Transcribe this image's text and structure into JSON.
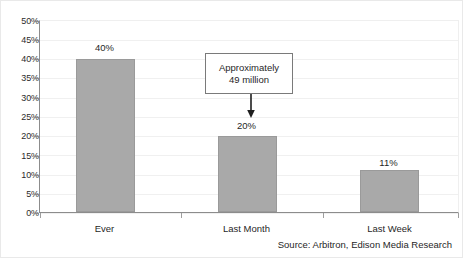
{
  "chart_data": {
    "type": "bar",
    "title": "",
    "subtitle": "",
    "xlabel": "",
    "ylabel": "",
    "categories": [
      "Ever",
      "Last Month",
      "Last Week"
    ],
    "values": [
      40,
      20,
      11
    ],
    "value_labels": [
      "40%",
      "20%",
      "11%"
    ],
    "ylim": [
      0,
      50
    ],
    "ytick_values": [
      0,
      5,
      10,
      15,
      20,
      25,
      30,
      35,
      40,
      45,
      50
    ],
    "ytick_labels": [
      "0%",
      "5%",
      "10%",
      "15%",
      "20%",
      "25%",
      "30%",
      "35%",
      "40%",
      "45%",
      "50%"
    ],
    "grid": true,
    "legend": "none",
    "bar_color": "#a9a9a9",
    "bar_edge_color": "#9a9a9a",
    "axis_color": "#8c8c8c",
    "gridline_color": "#f0f0f0",
    "annotations": [
      {
        "name": "approximately-49-million-callout",
        "line1": "Approximately",
        "line2": "49 million",
        "points_to_category": "Last Month",
        "arrow": "down"
      }
    ]
  },
  "source_note": "Source: Arbitron, Edison Media Research"
}
